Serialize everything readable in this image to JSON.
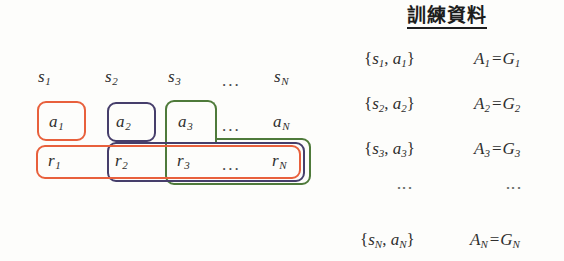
{
  "diagram": {
    "left_panel": {
      "state_row": {
        "name": "state-row",
        "cells": [
          {
            "base": "s",
            "sub": "1"
          },
          {
            "base": "s",
            "sub": "2"
          },
          {
            "base": "s",
            "sub": "3"
          },
          {
            "base": "…",
            "sub": ""
          },
          {
            "base": "s",
            "sub": "N"
          }
        ],
        "ellipsis": "..."
      },
      "action_row": {
        "name": "action-row",
        "cells": [
          {
            "base": "a",
            "sub": "1"
          },
          {
            "base": "a",
            "sub": "2"
          },
          {
            "base": "a",
            "sub": "3"
          },
          {
            "base": "…",
            "sub": ""
          },
          {
            "base": "a",
            "sub": "N"
          }
        ],
        "ellipsis": "..."
      },
      "reward_row": {
        "name": "reward-row",
        "cells": [
          {
            "base": "r",
            "sub": "1"
          },
          {
            "base": "r",
            "sub": "2"
          },
          {
            "base": "r",
            "sub": "3"
          },
          {
            "base": "…",
            "sub": ""
          },
          {
            "base": "r",
            "sub": "N"
          }
        ],
        "ellipsis": "..."
      },
      "groupings": [
        {
          "id": "group-1",
          "label": "group-orange-a1-r1-to-rN",
          "color": "#e8603c",
          "action_cell": "a1",
          "reward_span": "r1..rN"
        },
        {
          "id": "group-2",
          "label": "group-purple-a2-r2-to-rN",
          "color": "#463e6b",
          "action_cell": "a2",
          "reward_span": "r2..rN"
        },
        {
          "id": "group-3",
          "label": "group-green-a3-r3-to-rN",
          "color": "#4e7a3a",
          "action_cell": "a3",
          "reward_span": "r3..rN"
        }
      ]
    },
    "right_panel": {
      "title": "訓練資料",
      "vdots": "⋮",
      "rows": [
        {
          "pair": {
            "open": "{",
            "s_base": "s",
            "s_sub": "1",
            "comma": ",",
            "a_base": "a",
            "a_sub": "1",
            "close": "}"
          },
          "equation": {
            "a_base": "A",
            "a_sub": "1",
            "eq": "=",
            "g_base": "G",
            "g_sub": "1"
          }
        },
        {
          "pair": {
            "open": "{",
            "s_base": "s",
            "s_sub": "2",
            "comma": ",",
            "a_base": "a",
            "a_sub": "2",
            "close": "}"
          },
          "equation": {
            "a_base": "A",
            "a_sub": "2",
            "eq": "=",
            "g_base": "G",
            "g_sub": "2"
          }
        },
        {
          "pair": {
            "open": "{",
            "s_base": "s",
            "s_sub": "3",
            "comma": ",",
            "a_base": "a",
            "a_sub": "3",
            "close": "}"
          },
          "equation": {
            "a_base": "A",
            "a_sub": "3",
            "eq": "=",
            "g_base": "G",
            "g_sub": "3"
          }
        },
        {
          "pair": {
            "open": "{",
            "s_base": "s",
            "s_sub": "N",
            "comma": ",",
            "a_base": "a",
            "a_sub": "N",
            "close": "}"
          },
          "equation": {
            "a_base": "A",
            "a_sub": "N",
            "eq": "=",
            "g_base": "G",
            "g_sub": "N"
          }
        }
      ]
    },
    "colors": {
      "background": "#fdfdfb",
      "text": "#2f2f2f",
      "title": "#1d1d1d",
      "orange": "#e8603c",
      "purple": "#463e6b",
      "green": "#4e7a3a"
    }
  }
}
